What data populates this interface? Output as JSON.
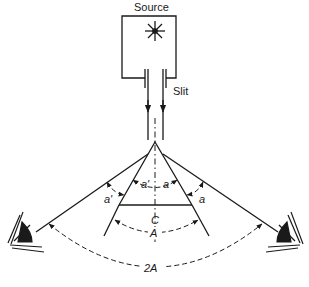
{
  "diagram": {
    "labels": {
      "source": "Source",
      "slit": "Slit",
      "angle_a_left_outer": "a'",
      "angle_a_left_inner": "a'",
      "angle_a_right_inner": "a",
      "angle_a_right_outer": "a",
      "center": "C",
      "apex_angle": "A",
      "total_angle": "2A"
    },
    "elements": [
      {
        "name": "source-box",
        "contains": "star-light-icon"
      },
      {
        "name": "slit",
        "type": "collimator"
      },
      {
        "name": "prism",
        "type": "triangle"
      },
      {
        "name": "left-eye-icon",
        "side": "left"
      },
      {
        "name": "right-eye-icon",
        "side": "right"
      }
    ],
    "colors": {
      "ink": "#1a1a1a",
      "background": "#ffffff"
    }
  }
}
